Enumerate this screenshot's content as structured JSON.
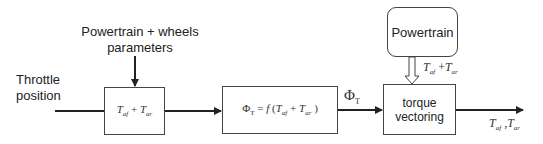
{
  "diagram": {
    "inputs": {
      "throttle_line1": "Throttle",
      "throttle_line2": "position",
      "params_line1": "Powertrain + wheels",
      "params_line2": "parameters"
    },
    "blocks": {
      "sum_block": {
        "T1": "T",
        "s1": "af",
        "plus": " + ",
        "T2": "T",
        "s2": "ar"
      },
      "phi_block": {
        "phi": "Φ",
        "phi_sub": "T",
        "eq": " = ",
        "f": "f",
        "open": " (",
        "T1": "T",
        "s1": "af",
        "plus": " + ",
        "T2": "T",
        "s2": "ar",
        "close": " )"
      },
      "powertrain_block": {
        "label": "Powertrain"
      },
      "torque_block": {
        "line1": "torque",
        "line2": "vectoring"
      }
    },
    "signals": {
      "phi_signal": {
        "phi": "Φ",
        "sub": "T"
      },
      "powertrain_signal": {
        "T1": "T",
        "s1": "af",
        "plus": " +",
        "T2": "T",
        "s2": "ar"
      },
      "output_signal": {
        "T1": "T",
        "s1": "af",
        "sep": " ,",
        "T2": "T",
        "s2": "ar"
      }
    },
    "colors": {
      "line": "#222222",
      "box_border": "#444444",
      "background": "#ffffff"
    }
  }
}
